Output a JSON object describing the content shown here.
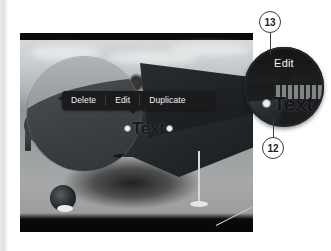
{
  "figure": {
    "photo_alt": "black and white photo of a vintage biplane on tarmac",
    "context_menu": {
      "items": [
        {
          "label": "Delete",
          "name": "delete"
        },
        {
          "label": "Edit",
          "name": "edit"
        },
        {
          "label": "Duplicate",
          "name": "duplicate"
        }
      ]
    },
    "text_object": {
      "value": "Text",
      "handle_left": "selection-handle-left",
      "handle_right": "selection-handle-right"
    }
  },
  "magnifier_left": {
    "name": "magnified-photo-region"
  },
  "magnifier_right": {
    "edit_label": "Edit",
    "text_value": "Text"
  },
  "callouts": [
    {
      "number": "13",
      "target": "Edit"
    },
    {
      "number": "12",
      "target": "Text"
    }
  ],
  "colors": {
    "menu_background": "#1b1b1d",
    "menu_text": "#f2f2f2",
    "callout_border": "#3b3b3b",
    "callout_background": "#ffffff",
    "page_gutter": "#e9e9e9"
  }
}
